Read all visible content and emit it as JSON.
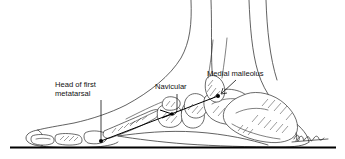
{
  "figure": {
    "kind": "anatomical-line-drawing",
    "background_color": "#ffffff",
    "ink_color": "#2b2b2b"
  },
  "labels": {
    "metatarsal": {
      "line1": "Head of first",
      "line2": "metatarsal"
    },
    "navicular": "Navicular",
    "malleolus": "Medial malleolus"
  },
  "annotations": {
    "measurement_line_name": "navicular-height-measurement-line",
    "endpoint_start": "first metatarsal head",
    "endpoint_end": "medial malleolus"
  },
  "signature": {
    "present": true,
    "description": "artist signature"
  }
}
